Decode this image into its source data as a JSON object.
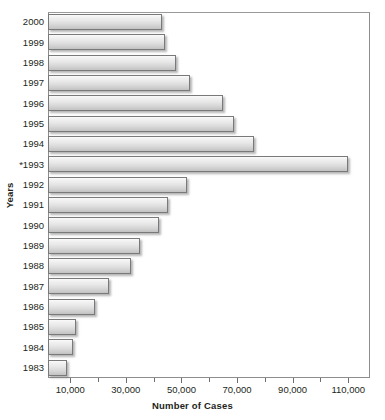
{
  "chart_data": {
    "type": "bar",
    "orientation": "horizontal",
    "title": "",
    "xlabel": "Number of Cases",
    "ylabel": "Years",
    "xlim": [
      2000,
      117000
    ],
    "axis_start_value": 2000,
    "grid": false,
    "legend": null,
    "xticks_major": [
      10000,
      30000,
      50000,
      70000,
      90000,
      110000
    ],
    "xticks_major_labels": [
      "10,000",
      "30,000",
      "50,000",
      "70,000",
      "90,000",
      "110,000"
    ],
    "xticks_minor": [
      20000,
      40000,
      60000,
      80000,
      100000
    ],
    "categories": [
      "2000",
      "1999",
      "1998",
      "1997",
      "1996",
      "1995",
      "1994",
      "*1993",
      "1992",
      "1991",
      "1990",
      "1989",
      "1988",
      "1987",
      "1986",
      "1985",
      "1984",
      "1983"
    ],
    "values": [
      43000,
      44000,
      48000,
      53000,
      65000,
      69000,
      76000,
      110000,
      52000,
      45000,
      42000,
      35000,
      32000,
      24000,
      19000,
      12000,
      11000,
      9000
    ],
    "bars": [
      {
        "category": "2000",
        "value": 43000
      },
      {
        "category": "1999",
        "value": 44000
      },
      {
        "category": "1998",
        "value": 48000
      },
      {
        "category": "1997",
        "value": 53000
      },
      {
        "category": "1996",
        "value": 65000
      },
      {
        "category": "1995",
        "value": 69000
      },
      {
        "category": "1994",
        "value": 76000
      },
      {
        "category": "*1993",
        "value": 110000
      },
      {
        "category": "1992",
        "value": 52000
      },
      {
        "category": "1991",
        "value": 45000
      },
      {
        "category": "1990",
        "value": 42000
      },
      {
        "category": "1989",
        "value": 35000
      },
      {
        "category": "1988",
        "value": 32000
      },
      {
        "category": "1987",
        "value": 24000
      },
      {
        "category": "1986",
        "value": 19000
      },
      {
        "category": "1985",
        "value": 12000
      },
      {
        "category": "1984",
        "value": 11000
      },
      {
        "category": "1983",
        "value": 9000
      }
    ],
    "colors": {
      "bar_fill_top": "#fbfbfb",
      "bar_fill_bottom": "#c2c2c2",
      "bar_border": "#77797b",
      "frame": "#8d8d8d",
      "text": "#231f20",
      "background": "#ffffff"
    }
  }
}
